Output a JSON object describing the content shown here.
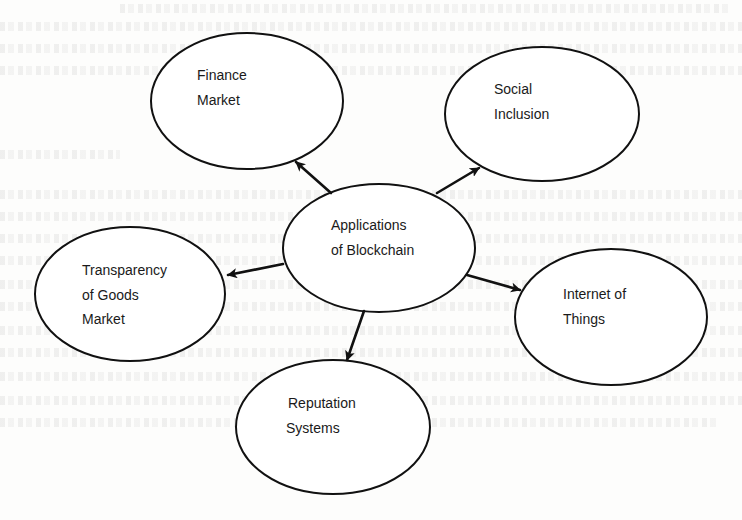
{
  "diagram": {
    "type": "mind-map",
    "center": {
      "id": "center",
      "lines": [
        "Applications",
        "of Blockchain"
      ]
    },
    "nodes": [
      {
        "id": "finance-market",
        "lines": [
          "Finance",
          "Market"
        ]
      },
      {
        "id": "social-inclusion",
        "lines": [
          "Social",
          "Inclusion"
        ]
      },
      {
        "id": "transparency-goods-market",
        "lines": [
          "Transparency",
          "of Goods",
          "Market"
        ]
      },
      {
        "id": "internet-of-things",
        "lines": [
          "Internet of",
          "Things"
        ]
      },
      {
        "id": "reputation-systems",
        "lines": [
          "Reputation",
          "Systems"
        ]
      }
    ],
    "edges": [
      {
        "from": "center",
        "to": "finance-market",
        "style": "arrow"
      },
      {
        "from": "center",
        "to": "social-inclusion",
        "style": "arrow"
      },
      {
        "from": "center",
        "to": "transparency-goods-market",
        "style": "arrow"
      },
      {
        "from": "center",
        "to": "internet-of-things",
        "style": "arrow"
      },
      {
        "from": "center",
        "to": "reputation-systems",
        "style": "arrow"
      }
    ]
  },
  "colors": {
    "stroke": "#111111",
    "text": "#1a1a1a",
    "background": "#fdfdfc"
  }
}
